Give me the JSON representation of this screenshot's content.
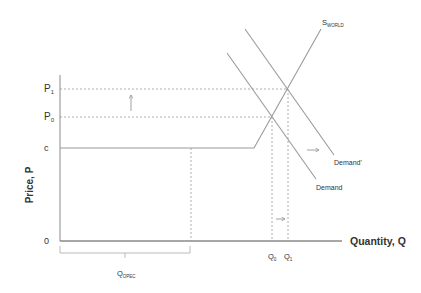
{
  "diagram": {
    "y_axis_label": "Price, P",
    "x_axis_label": "Quantity, Q",
    "origin_label": "0",
    "price_labels": {
      "p1": "P",
      "p1_sub": "1",
      "p0": "P",
      "p0_sub": "0",
      "c": "c"
    },
    "quantity_labels": {
      "q0": "Q",
      "q0_sub": "0",
      "q1": "Q",
      "q1_sub": "1",
      "qopec": "Q",
      "qopec_sub": "OPEC"
    },
    "curves": {
      "supply": "S",
      "supply_sub": "WORLD",
      "demand": "Demand",
      "demand_shifted": "Demand'"
    },
    "colors": {
      "line": "#9a9a9a",
      "axis": "#7a7a7a",
      "text": "#333333"
    }
  }
}
